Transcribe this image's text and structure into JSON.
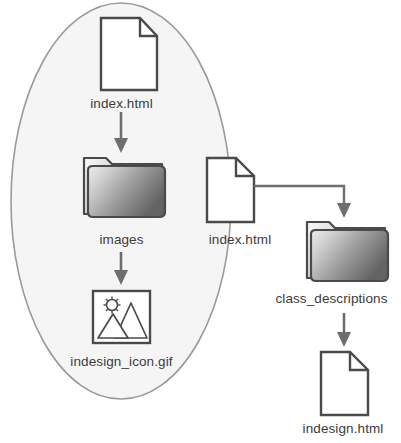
{
  "diagram": {
    "type": "file-structure-tree",
    "grouping_shape": "ellipse",
    "colors": {
      "ellipse_fill": "#f5f5f5",
      "ellipse_stroke": "#9a9a9a",
      "icon_stroke": "#4a4a4a",
      "icon_fill": "#ffffff",
      "arrow": "#6e6e6e",
      "folder_gradient_light": "#e9e9e9",
      "folder_gradient_dark": "#6f6f6f",
      "text": "#3b3b3b"
    },
    "nodes": [
      {
        "id": "index-top",
        "label": "index.html",
        "icon": "document-icon"
      },
      {
        "id": "images",
        "label": "images",
        "icon": "folder-icon"
      },
      {
        "id": "indesign-gif",
        "label": "indesign_icon.gif",
        "icon": "image-file-icon"
      },
      {
        "id": "index-right",
        "label": "index.html",
        "icon": "document-icon"
      },
      {
        "id": "class-desc",
        "label": "class_descriptions",
        "icon": "folder-icon"
      },
      {
        "id": "indesign-html",
        "label": "indesign.html",
        "icon": "document-icon"
      }
    ],
    "connectors": [
      {
        "from": "index-top",
        "to": "images",
        "style": "straight-arrow-down"
      },
      {
        "from": "images",
        "to": "indesign-gif",
        "style": "straight-arrow-down"
      },
      {
        "from": "index-right",
        "to": "class-desc",
        "style": "elbow-arrow-right-down"
      },
      {
        "from": "class-desc",
        "to": "indesign-html",
        "style": "straight-arrow-down"
      }
    ],
    "labels": {
      "index_top": "index.html",
      "images": "images",
      "indesign_gif": "indesign_icon.gif",
      "index_right": "index.html",
      "class_descriptions": "class_descriptions",
      "indesign_html": "indesign.html"
    }
  }
}
